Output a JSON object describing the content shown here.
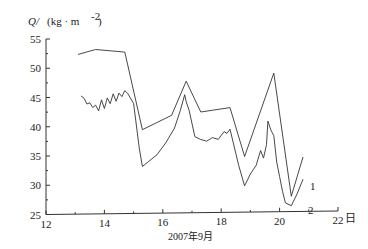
{
  "chart_data": {
    "type": "line",
    "title": "",
    "ylabel": "Q/ (kg·m⁻²)",
    "xlabel": "2007年9月",
    "x_unit": "日",
    "xlim": [
      12,
      22
    ],
    "ylim": [
      25,
      55
    ],
    "xticks": [
      12,
      14,
      16,
      18,
      20,
      22
    ],
    "yticks": [
      25,
      30,
      35,
      40,
      45,
      50,
      55
    ],
    "grid": false,
    "legend": "inline labels at line ends",
    "series": [
      {
        "name": "1",
        "x": [
          13.1,
          13.7,
          14.7,
          15.3,
          16.3,
          16.8,
          17.3,
          18.3,
          18.8,
          19.8,
          20.4,
          20.8
        ],
        "y": [
          52.3,
          53.1,
          52.6,
          39.3,
          41.7,
          47.5,
          42.2,
          42.9,
          34.5,
          48.7,
          27.6,
          34.3
        ]
      },
      {
        "name": "2",
        "x": [
          13.2,
          13.3,
          13.4,
          13.5,
          13.6,
          13.7,
          13.8,
          13.9,
          14.0,
          14.1,
          14.2,
          14.3,
          14.4,
          14.5,
          14.6,
          14.7,
          14.8,
          15.0,
          15.2,
          15.3,
          15.5,
          15.8,
          16.1,
          16.4,
          16.6,
          16.75,
          16.8,
          16.9,
          17.1,
          17.3,
          17.5,
          17.7,
          17.9,
          18.1,
          18.2,
          18.3,
          18.6,
          18.8,
          19.0,
          19.2,
          19.35,
          19.45,
          19.55,
          19.6,
          19.7,
          19.8,
          19.9,
          20.0,
          20.1,
          20.2,
          20.4,
          20.6,
          20.8
        ],
        "y": [
          45.2,
          44.8,
          43.8,
          44.0,
          43.2,
          43.6,
          42.6,
          44.5,
          43.0,
          44.8,
          43.8,
          45.5,
          44.2,
          45.6,
          45.0,
          46.0,
          45.5,
          43.8,
          36.0,
          33.0,
          33.8,
          35.0,
          37.0,
          39.5,
          42.5,
          45.2,
          44.0,
          42.5,
          38.0,
          37.5,
          37.2,
          37.8,
          37.5,
          38.8,
          38.5,
          39.2,
          33.0,
          29.5,
          31.5,
          33.0,
          35.5,
          34.2,
          36.5,
          40.5,
          39.0,
          38.0,
          33.5,
          31.0,
          28.5,
          26.5,
          26.0,
          28.0,
          30.5
        ]
      }
    ],
    "annotations": [
      "1",
      "2"
    ]
  },
  "axes": {
    "y_label_q": "Q/",
    "y_label_unit": "(kg · m",
    "y_label_exp": "-2",
    "y_label_close": ")",
    "x_unit": "日",
    "x_caption": "2007年9月",
    "x_tick_labels": [
      "12",
      "14",
      "16",
      "18",
      "20",
      "22"
    ],
    "y_tick_labels": [
      "25",
      "30",
      "35",
      "40",
      "45",
      "50",
      "55"
    ]
  }
}
